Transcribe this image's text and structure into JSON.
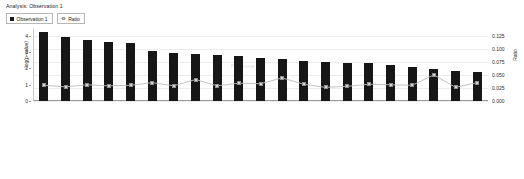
{
  "header": {
    "title": "Analysis: Observation 1"
  },
  "legend": {
    "position": "top-left",
    "items": [
      {
        "label": "Observation 1",
        "marker": "filled-square",
        "color": "#161616"
      },
      {
        "label": "Ratio",
        "marker": "line-square",
        "color": "#bcbcbc"
      }
    ]
  },
  "axes": {
    "left_label": "-log(p-value)",
    "right_label": "Ratio",
    "left_ticks": [
      "4",
      "3",
      "2",
      "1",
      "0"
    ],
    "right_ticks": [
      "0.125",
      "0.100",
      "0.075",
      "0.050",
      "0.025",
      "0.000"
    ]
  },
  "watermark": "Preview",
  "chart_data": {
    "type": "bar",
    "title": "Analysis: Observation 1",
    "xlabel": "",
    "ylabel": "-log(p-value)",
    "y2label": "Ratio",
    "ylim": [
      0,
      4.4
    ],
    "y2lim": [
      0,
      0.1375
    ],
    "grid": true,
    "legend_position": "top-left",
    "categories": [
      "Pyrimidine Metabolism",
      "Arginine and Proline Metabolism",
      "Phenylalanine Metabolism",
      "Alanine and Aspartate Metabolism",
      "Glutamate Metabolism",
      "Phenylalanine, Tyrosine and Tryptophan Biosynthesis",
      "Tyrosine Metabolism",
      "Pantothenate and CoA Biosynthesis",
      "Citrate Cycle",
      "Pentose Phosphate Pathway",
      "Biosynthesis of Steroids",
      "Urea Cycle and Metabolism of Amino Groups",
      "Histidine Metabolism",
      "β-alanine Metabolism",
      "Fructose and Mannose Metabolism",
      "Pyruvate Metabolism",
      "Bile Acid Biosynthesis",
      "D-glutamine and D-glutamate Metabolism",
      "Purine Metabolism",
      "Fatty Acid Biosynthesis",
      "Fatty Acid Metabolism"
    ],
    "series": [
      {
        "name": "Observation 1",
        "axis": "left",
        "type": "bar",
        "color": "#161616",
        "values": [
          4.2,
          3.9,
          3.75,
          3.6,
          3.55,
          3.05,
          2.95,
          2.85,
          2.8,
          2.75,
          2.6,
          2.55,
          2.45,
          2.4,
          2.35,
          2.3,
          2.2,
          2.05,
          1.95,
          1.85,
          1.75
        ]
      },
      {
        "name": "Ratio",
        "axis": "right",
        "type": "line",
        "color": "#bcbcbc",
        "marker": "square",
        "values": [
          0.03,
          0.027,
          0.031,
          0.029,
          0.03,
          0.035,
          0.029,
          0.041,
          0.029,
          0.034,
          0.033,
          0.044,
          0.032,
          0.026,
          0.028,
          0.032,
          0.031,
          0.03,
          0.05,
          0.026,
          0.035
        ]
      }
    ]
  }
}
